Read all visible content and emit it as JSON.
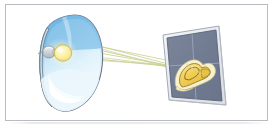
{
  "figure": {
    "frame_border_color": "#b9bcc0",
    "background_color": "#ffffff"
  },
  "reflector": {
    "name": "curved reflector dish",
    "outline_color": "#6a7380",
    "fill_top_color": "#5ea9dd",
    "fill_mid_color": "#bfe0f4",
    "fill_bottom_color": "#eaf6fc",
    "rim_color": "#9fcde9",
    "highlight_color": "#ffffff"
  },
  "bulb": {
    "name": "light bulb source",
    "glass_color": "#fdf0a8",
    "glass_edge_color": "#d9c35a",
    "base_color": "#d7dbe0",
    "base_edge_color": "#8d949d",
    "glow_color": "#fff9d0"
  },
  "rays": {
    "name": "light rays",
    "color": "#c2c98a",
    "accent_color": "#d7dba3",
    "count": 6,
    "width": 0.8
  },
  "screen": {
    "name": "projection screen panel",
    "panel_color": "#737e95",
    "panel_edge_color": "#5d677c",
    "frame_color": "#e9ebee",
    "frame_edge_color": "#9aa2ad",
    "grid_color": "#9aa5ba",
    "grid_count": 2
  },
  "projected_image": {
    "name": "projected yellow shape",
    "fill_color": "#f2cf55",
    "pale_fill_color": "#f7efc9",
    "outline_color": "#8a6f1e",
    "shade_color": "#e0b93e"
  }
}
